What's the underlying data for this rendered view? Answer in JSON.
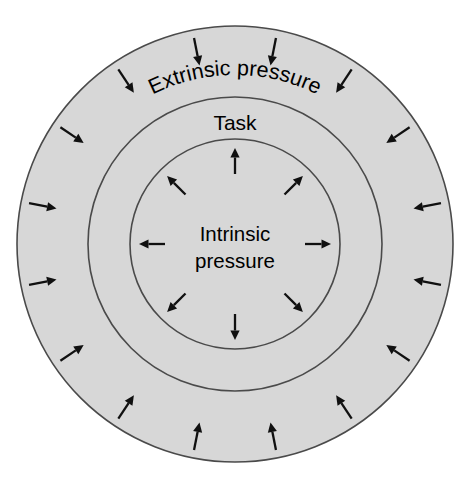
{
  "diagram": {
    "type": "concentric-rings",
    "background_color": "#ffffff",
    "ring_fill_color": "#d7d7d7",
    "ring_stroke_color": "#4a4a4a",
    "arrow_color": "#101010",
    "center": {
      "x": 235,
      "y": 244
    },
    "rings": [
      {
        "id": "outer",
        "label": "Extrinsic pressure",
        "label_style": "curved-along-arc",
        "radius": 218,
        "arrow_count": 16,
        "arrow_direction": "inward",
        "arrow_angle_step_degrees": 22.5,
        "arrow_radius": 196,
        "arrow_length": 28
      },
      {
        "id": "middle",
        "label": "Task",
        "label_style": "horizontal",
        "radius": 147,
        "arrow_count": 0,
        "arrow_direction": "none"
      },
      {
        "id": "inner",
        "label_lines": [
          "Intrinsic",
          "pressure"
        ],
        "label_style": "horizontal-two-line",
        "radius": 105,
        "arrow_count": 8,
        "arrow_direction": "outward",
        "arrow_angle_step_degrees": 45,
        "arrow_radius": 83,
        "arrow_length": 26
      }
    ],
    "labels": {
      "extrinsic": "Extrinsic pressure",
      "task": "Task",
      "intrinsic_line1": "Intrinsic",
      "intrinsic_line2": "pressure"
    }
  }
}
